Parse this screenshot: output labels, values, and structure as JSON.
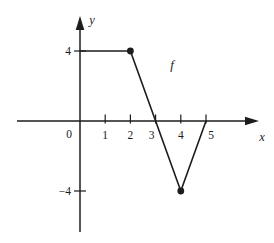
{
  "figure": {
    "background": "#ffffff",
    "ink_color": "#1c1c1c"
  },
  "chart_data": {
    "type": "line",
    "title": "",
    "xlabel": "x",
    "ylabel": "y",
    "function_label": "f",
    "function_label_pos": [
      3.65,
      3.2
    ],
    "origin_label": "0",
    "xlim": [
      -2.5,
      7.1
    ],
    "ylim": [
      -6.3,
      6.1
    ],
    "grid": false,
    "x_ticks": [
      {
        "value": 1,
        "label": "1",
        "dx": 0
      },
      {
        "value": 2,
        "label": "2",
        "dx": 0
      },
      {
        "value": 3,
        "label": "3",
        "dx": -4
      },
      {
        "value": 4,
        "label": "4",
        "dx": 0
      },
      {
        "value": 5,
        "label": "5",
        "dx": 5
      }
    ],
    "y_ticks": [
      {
        "value": 4,
        "label": "4"
      },
      {
        "value": -4,
        "label": "−4"
      }
    ],
    "series": [
      {
        "name": "f",
        "points": [
          [
            0,
            4
          ],
          [
            2,
            4
          ],
          [
            4,
            -4
          ],
          [
            5,
            0
          ]
        ],
        "marked_points": [
          [
            2,
            4
          ],
          [
            4,
            -4
          ]
        ]
      }
    ]
  }
}
